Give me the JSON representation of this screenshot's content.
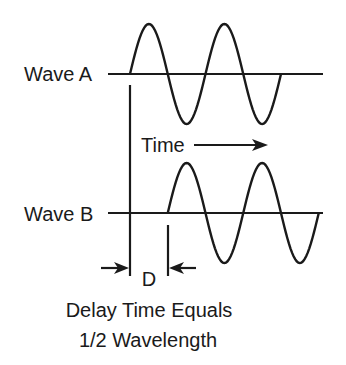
{
  "diagram": {
    "wave_a": {
      "label": "Wave A",
      "start_phase": "up",
      "half_cycles": 4
    },
    "wave_b": {
      "label": "Wave B",
      "start_phase": "up",
      "half_cycles": 4,
      "delay_half_cycles": 1
    },
    "time_label": "Time",
    "delay_marker_label": "D",
    "caption_line1": "Delay Time Equals",
    "caption_line2": "1/2 Wavelength",
    "colors": {
      "ink": "#1a1a1a",
      "background": "#ffffff"
    }
  }
}
